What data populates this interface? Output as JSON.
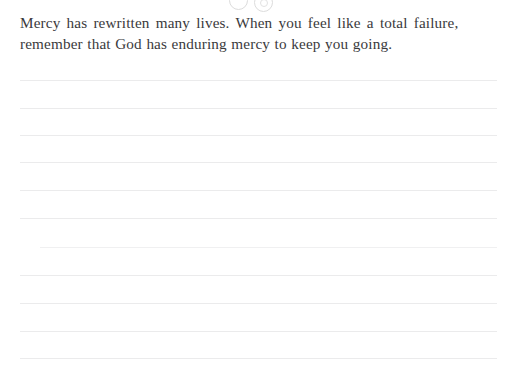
{
  "page": {
    "background_color": "#ffffff",
    "width": 516,
    "height": 377
  },
  "ornament": {
    "name": "decorative-circles",
    "description": "two faint outlined circles clipped at top edge",
    "color": "#dcdcdc",
    "circles": [
      {
        "left": 229,
        "top": -9,
        "size": 17
      },
      {
        "left": 254,
        "top": -7,
        "size": 17
      }
    ]
  },
  "quote": {
    "text_color": "#3a3a3c",
    "full_text": "Mercy has rewritten many lives. When you feel like a total failure, remember that God has enduring mercy to keep you going.",
    "lines": [
      "Mercy has rewritten many lives. When you feel like a total failure,",
      "remember that God has enduring mercy to keep you going."
    ]
  },
  "ruled_lines": {
    "color": "#ebebec",
    "left": 20,
    "right": 497,
    "count": 11,
    "rows": [
      {
        "y": 80,
        "left": 20,
        "right": 497,
        "weight": "normal"
      },
      {
        "y": 108,
        "left": 20,
        "right": 497,
        "weight": "normal"
      },
      {
        "y": 135,
        "left": 20,
        "right": 497,
        "weight": "normal"
      },
      {
        "y": 162,
        "left": 20,
        "right": 497,
        "weight": "normal"
      },
      {
        "y": 190,
        "left": 20,
        "right": 497,
        "weight": "normal"
      },
      {
        "y": 218,
        "left": 20,
        "right": 497,
        "weight": "normal"
      },
      {
        "y": 247,
        "left": 40,
        "right": 497,
        "weight": "soft"
      },
      {
        "y": 275,
        "left": 20,
        "right": 497,
        "weight": "normal"
      },
      {
        "y": 303,
        "left": 20,
        "right": 497,
        "weight": "normal"
      },
      {
        "y": 331,
        "left": 20,
        "right": 497,
        "weight": "normal"
      },
      {
        "y": 358,
        "left": 20,
        "right": 497,
        "weight": "normal"
      }
    ]
  }
}
